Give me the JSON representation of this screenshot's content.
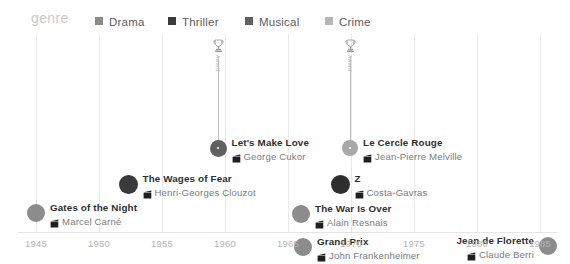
{
  "legend": {
    "title": "genre",
    "items": [
      {
        "label": "Drama",
        "color": "#8c8c8c",
        "x": 95
      },
      {
        "label": "Thriller",
        "color": "#3a3a3a",
        "x": 168
      },
      {
        "label": "Musical",
        "color": "#606060",
        "x": 245
      },
      {
        "label": "Crime",
        "color": "#b5b5b5",
        "x": 325
      }
    ]
  },
  "axis": {
    "ticks": [
      "1945",
      "1950",
      "1955",
      "1960",
      "1965",
      "1970",
      "1975",
      "1980",
      "1985"
    ],
    "tick_x": [
      36,
      99,
      162,
      225,
      288,
      351,
      414,
      477,
      540
    ],
    "xmin": 1945,
    "xmax": 1985,
    "grid": true
  },
  "awards": [
    {
      "label": "Award",
      "x": 218,
      "icon": "trophy-icon"
    },
    {
      "label": "Award",
      "x": 350,
      "icon": "trophy-icon"
    }
  ],
  "chart_data": {
    "type": "scatter",
    "title": "",
    "xlabel": "",
    "ylabel": "",
    "xlim": [
      1945,
      1985
    ],
    "grid": true,
    "legend_position": "top",
    "categories": [
      "Drama",
      "Thriller",
      "Musical",
      "Crime"
    ],
    "points": [
      {
        "title": "Gates of the Night",
        "director": "Marcel Carné",
        "genre": "Drama",
        "year": 1946,
        "x": 36,
        "y": 179,
        "r": 9,
        "color": "#8c8c8c",
        "label_side": "right",
        "award": false
      },
      {
        "title": "The Wages of Fear",
        "director": "Henri-Georges Clouzot",
        "genre": "Thriller",
        "year": 1953,
        "x": 128,
        "y": 150,
        "r": 9.5,
        "color": "#3a3a3a",
        "label_side": "right",
        "award": false
      },
      {
        "title": "Let's Make Love",
        "director": "George Cukor",
        "genre": "Musical",
        "year": 1960,
        "x": 218,
        "y": 114,
        "r": 8.5,
        "color": "#606060",
        "label_side": "right",
        "award": true
      },
      {
        "title": "Le Cercle Rouge",
        "director": "Jean-Pierre Melville",
        "genre": "Crime",
        "year": 1970,
        "x": 350,
        "y": 114,
        "r": 8,
        "color": "#a8a8a8",
        "label_side": "right",
        "award": true
      },
      {
        "title": "Z",
        "director": "Costa-Gavras",
        "genre": "Thriller",
        "year": 1969,
        "x": 340,
        "y": 150,
        "r": 9.5,
        "color": "#2e2e2e",
        "label_side": "right",
        "award": false
      },
      {
        "title": "The War Is Over",
        "director": "Alain Resnais",
        "genre": "Drama",
        "year": 1966,
        "x": 301,
        "y": 180,
        "r": 9,
        "color": "#8c8c8c",
        "label_side": "right",
        "award": false
      },
      {
        "title": "Grand Prix",
        "director": "John Frankenheimer",
        "genre": "Drama",
        "year": 1966,
        "x": 303,
        "y": 213,
        "r": 9,
        "color": "#8c8c8c",
        "label_side": "right",
        "award": false
      },
      {
        "title": "Jean de Florette",
        "director": "Claude Berri",
        "genre": "Drama",
        "year": 1986,
        "x": 548,
        "y": 212,
        "r": 9,
        "color": "#8c8c8c",
        "label_side": "left",
        "award": false
      }
    ]
  }
}
